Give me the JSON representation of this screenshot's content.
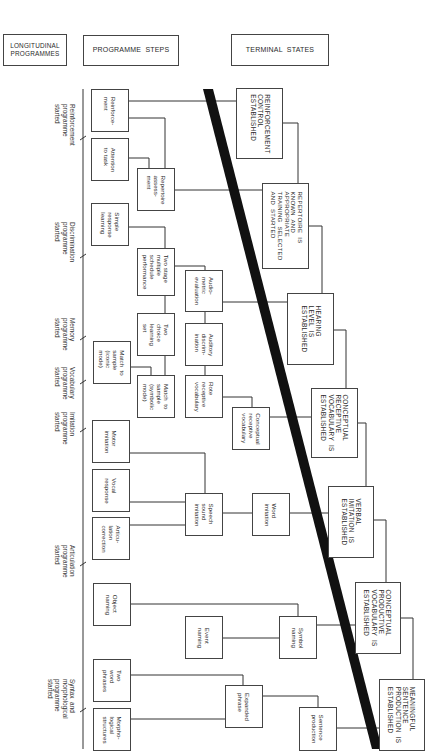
{
  "headers": {
    "longitudinal": "LONGITUDINAL\nPROGRAMMES",
    "steps": "PROGRAMME  STEPS",
    "terminal": "TERMINAL  STATES"
  },
  "programmes": [
    {
      "label": "Reinforcement\nprogramme\nstarted"
    },
    {
      "label": "Discrimination\nprogramme\nstarted"
    },
    {
      "label": "Memory\nprogramme\nstarted"
    },
    {
      "label": "Vocabulary\nprogramme\nstarted"
    },
    {
      "label": "Imitation\nprogramme\nstarted"
    },
    {
      "label": "Articulation\nprogramme\nstarted"
    },
    {
      "label": "Syntax  and\nmorphological\nprogramme\nstarted"
    }
  ],
  "steps": [
    {
      "label": "Reinforce-\nment"
    },
    {
      "label": "Attention\nto task"
    },
    {
      "label": "Repertoire\nassess-\nment"
    },
    {
      "label": "Simple\nresponse\nlearning"
    },
    {
      "label": "Two stage\nmultiple\nschedule\nperformance"
    },
    {
      "label": "Audio-\nmetric\nevaluation"
    },
    {
      "label": "Two\nchoice\nlearning\nset"
    },
    {
      "label": "Auditory\ndiscrim-\nination"
    },
    {
      "label": "Match  to\nsample\n(iconic\nmode)"
    },
    {
      "label": "Match  to\nsample\n(symbolic\nmode)"
    },
    {
      "label": "Rote\nreceptive\nvocabulary"
    },
    {
      "label": "Conceptual\nreceptive\nvocabulary"
    },
    {
      "label": "Motor\nimitation"
    },
    {
      "label": "Vocal\nresponse"
    },
    {
      "label": "Articu-\nlation\ncorrection"
    },
    {
      "label": "Speech\nsound\nimitation"
    },
    {
      "label": "Word\nimitation"
    },
    {
      "label": "Object\nnaming"
    },
    {
      "label": "Event\nnaming"
    },
    {
      "label": "Symbol\nnaming"
    },
    {
      "label": "Two\nword\nphrases"
    },
    {
      "label": "Morpho-\nlogical\nstructures"
    },
    {
      "label": "Expanded\nphrase"
    },
    {
      "label": "Sentence\nproduction"
    }
  ],
  "terminal_states": [
    {
      "label": "REINFORCEMENT\nCONTROL\nESTABLISHED"
    },
    {
      "label": "REPERTOIRE  IS\nKNOWN  AND\nAPPROPRIATE\nTRAINING  SELECTED\nAND  STARTED"
    },
    {
      "label": "HEARING\nLEVEL  IS\nESTABLISHED"
    },
    {
      "label": "CONCEPTUAL\nRECEPTIVE\nVOCABULARY  IS\nESTABLISHED"
    },
    {
      "label": "VERBAL\nIMITATION  IS\nESTABLISHED"
    },
    {
      "label": "CONCEPTUAL\nPRODUCTIVE\nVOCABULARY  IS\nESTABLISHED"
    },
    {
      "label": "MEANINGFUL\nSENTENCE\nPRODUCTION  IS\nESTABLISHED"
    }
  ],
  "colors": {
    "line": "#333333",
    "divider": "#111111",
    "background": "#ffffff"
  }
}
